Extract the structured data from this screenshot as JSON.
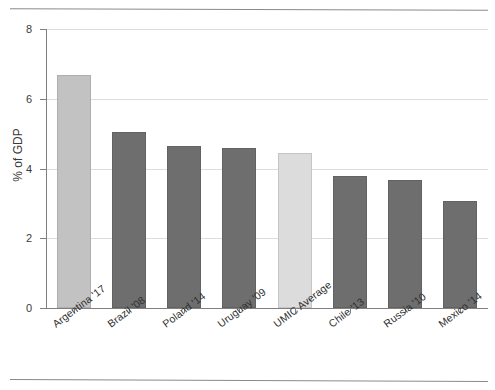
{
  "page": {
    "top_rule": "horizontal-rule",
    "bottom_rule": "horizontal-rule"
  },
  "chart_data": {
    "type": "bar",
    "title": "",
    "subtitle": "",
    "xlabel": "",
    "ylabel": "% of GDP",
    "ylim": [
      0,
      8
    ],
    "yticks": [
      "0",
      "2",
      "4",
      "6",
      "8"
    ],
    "ytick_values": [
      0,
      2,
      4,
      6,
      8
    ],
    "grid": true,
    "grid_axis": "y",
    "legend": "none",
    "categories": [
      "Argentina '17",
      "Brazil '08",
      "Poland '14",
      "Uruguay '09",
      "UMIC Average",
      "Chile '13",
      "Russia '10",
      "Mexico '14"
    ],
    "values": [
      6.68,
      5.04,
      4.64,
      4.58,
      4.44,
      3.78,
      3.67,
      3.07
    ],
    "bar_colors": [
      "#c2c2c2",
      "#6e6e6e",
      "#6e6e6e",
      "#6e6e6e",
      "#dcdcdc",
      "#6e6e6e",
      "#6e6e6e",
      "#6e6e6e"
    ],
    "colors": {
      "highlight": "#c2c2c2",
      "default": "#6e6e6e",
      "average": "#dcdcdc",
      "axis": "#808080",
      "grid": "#dddddd",
      "text": "#2f2f2f"
    }
  }
}
